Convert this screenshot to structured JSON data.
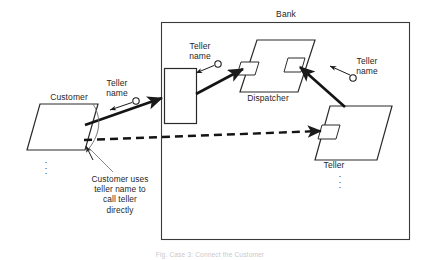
{
  "figure": {
    "title_caption": "Fig. Case 3: Connect the Customer",
    "boundary": {
      "label": "Bank"
    },
    "nodes": [
      {
        "id": "customer",
        "label": "Customer",
        "shape": "parallelogram",
        "label_position": "above"
      },
      {
        "id": "interface",
        "label": "",
        "shape": "rectangle",
        "label_position": "none"
      },
      {
        "id": "dispatcher",
        "label": "Dispatcher",
        "shape": "parallelogram",
        "label_position": "below",
        "ports": 2
      },
      {
        "id": "teller",
        "label": "Teller",
        "shape": "parallelogram",
        "label_position": "below",
        "ports": 1
      }
    ],
    "ellipses": [
      {
        "id": "customer-ellipsis",
        "under": "customer"
      },
      {
        "id": "teller-ellipsis",
        "under": "teller"
      }
    ],
    "labels": {
      "teller_name_left": "Teller\nname",
      "teller_name_middle": "Teller\nname",
      "teller_name_right": "Teller\nname"
    },
    "annotation": {
      "text": "Customer uses\nteller name to\ncall teller\ndirectly"
    },
    "edges": [
      {
        "id": "customer-to-interface",
        "style": "solid-thick",
        "from": "customer",
        "to": "interface",
        "carries": "Teller name"
      },
      {
        "id": "interface-to-dispatcher",
        "style": "solid-thick",
        "from": "interface",
        "to": "dispatcher",
        "carries": "Teller name"
      },
      {
        "id": "teller-to-dispatcher",
        "style": "solid-thick",
        "from": "teller",
        "to": "dispatcher",
        "carries": "Teller name"
      },
      {
        "id": "customer-to-teller",
        "style": "dashed-thick",
        "from": "customer",
        "to": "teller",
        "carries": "direct call"
      }
    ],
    "colors": {
      "ink": "#1a1a1a",
      "line": "#2a2a2a",
      "background": "#ffffff",
      "caption": "#c9c9c9"
    }
  }
}
